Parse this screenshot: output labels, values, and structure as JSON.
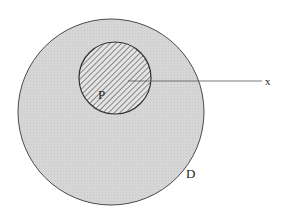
{
  "diagram": {
    "outer_region": {
      "label": "D",
      "cx": 111,
      "cy": 112,
      "r": 93,
      "fill": "#d6d6d6",
      "stroke": "#4a4a4a"
    },
    "inner_region": {
      "label": "P",
      "cx": 115,
      "cy": 78,
      "r": 36,
      "fill": "#e4e4e4",
      "hatch_color": "#555555",
      "stroke": "#333333"
    },
    "ray": {
      "label": "x",
      "x1": 128,
      "y1": 81,
      "x2": 262,
      "y2": 81,
      "stroke": "#555555"
    }
  }
}
